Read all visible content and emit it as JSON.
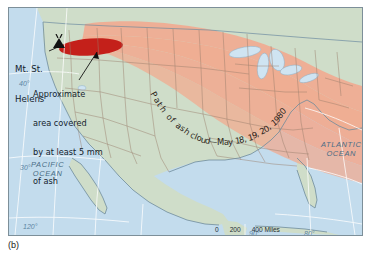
{
  "figure": {
    "panel_label": "(b)",
    "map_kind": "thematic-reference-map",
    "region": "Conterminous United States"
  },
  "colors": {
    "ocean": "#c3dced",
    "land": "#cfddc9",
    "land_under_plume": "#f2a98e",
    "ash_plume": "#f2a98e",
    "heavy_ash_ellipse": "#c4201a",
    "lakes": "#cfe4f2",
    "state_border": "#9a7f6d",
    "coastline": "#6f8b9c",
    "graticule": "#ffffff",
    "frame": "#7d8f99",
    "label_dark": "#15242e",
    "ocean_label": "#4a6e86"
  },
  "annotations": {
    "volcano": {
      "name": "Mt. St. Helens",
      "line1": "Mt. St.",
      "line2": "Helens",
      "marker": "volcano-marker"
    },
    "ash_area": {
      "line1": "Approximate",
      "line2": "area covered",
      "line3": "by at least 5 mm",
      "line4": "of ash",
      "full_text": "Approximate area covered by at least 5 mm of ash"
    },
    "ash_path": {
      "full_text": "Path of ash cloud—May 18, 19, 20, 1980",
      "words": [
        {
          "text": "P",
          "x": 144,
          "y": 79,
          "rot": 62
        },
        {
          "text": "a",
          "x": 147,
          "y": 85,
          "rot": 60
        },
        {
          "text": "t",
          "x": 150,
          "y": 90,
          "rot": 58
        },
        {
          "text": "h",
          "x": 153,
          "y": 94,
          "rot": 56
        },
        {
          "text": " ",
          "x": 157,
          "y": 99,
          "rot": 54
        },
        {
          "text": "o",
          "x": 159,
          "y": 102,
          "rot": 50
        },
        {
          "text": "f",
          "x": 163,
          "y": 106,
          "rot": 48
        },
        {
          "text": " ",
          "x": 166,
          "y": 109,
          "rot": 45
        },
        {
          "text": "a",
          "x": 168,
          "y": 111,
          "rot": 42
        },
        {
          "text": "s",
          "x": 172,
          "y": 114,
          "rot": 38
        },
        {
          "text": "h",
          "x": 176,
          "y": 117,
          "rot": 35
        },
        {
          "text": " ",
          "x": 180,
          "y": 119,
          "rot": 32
        },
        {
          "text": "c",
          "x": 182,
          "y": 121,
          "rot": 28
        },
        {
          "text": "l",
          "x": 186,
          "y": 123,
          "rot": 24
        },
        {
          "text": "o",
          "x": 188,
          "y": 124,
          "rot": 20
        },
        {
          "text": "u",
          "x": 192,
          "y": 126,
          "rot": 16
        },
        {
          "text": "d",
          "x": 196,
          "y": 127,
          "rot": 12
        },
        {
          "text": "—",
          "x": 200,
          "y": 128,
          "rot": 6
        },
        {
          "text": "M",
          "x": 208,
          "y": 129,
          "rot": 0
        },
        {
          "text": "a",
          "x": 215,
          "y": 129,
          "rot": -2
        },
        {
          "text": "y",
          "x": 219,
          "y": 129,
          "rot": -4
        },
        {
          "text": " ",
          "x": 224,
          "y": 129,
          "rot": -6
        },
        {
          "text": "1",
          "x": 226,
          "y": 128,
          "rot": -8
        },
        {
          "text": "8",
          "x": 230,
          "y": 127,
          "rot": -10
        },
        {
          "text": ",",
          "x": 235,
          "y": 126,
          "rot": -12
        },
        {
          "text": "1",
          "x": 239,
          "y": 125,
          "rot": -14
        },
        {
          "text": "9",
          "x": 243,
          "y": 123,
          "rot": -17
        },
        {
          "text": ",",
          "x": 247,
          "y": 121,
          "rot": -20
        },
        {
          "text": "2",
          "x": 251,
          "y": 119,
          "rot": -24
        },
        {
          "text": "0",
          "x": 255,
          "y": 117,
          "rot": -28
        },
        {
          "text": ",",
          "x": 259,
          "y": 114,
          "rot": -32
        },
        {
          "text": "1",
          "x": 263,
          "y": 111,
          "rot": -36
        },
        {
          "text": "9",
          "x": 266,
          "y": 108,
          "rot": -40
        },
        {
          "text": "8",
          "x": 269,
          "y": 104,
          "rot": -44
        },
        {
          "text": "0",
          "x": 272,
          "y": 100,
          "rot": -48
        }
      ]
    }
  },
  "oceans": [
    {
      "id": "pacific",
      "line1": "PACIFIC",
      "line2": "OCEAN",
      "x": 22,
      "y": 152
    },
    {
      "id": "atlantic",
      "line1": "ATLANTIC",
      "line2": "OCEAN",
      "x": 312,
      "y": 132
    }
  ],
  "graticule_labels": [
    {
      "id": "lat-40",
      "text": "40°",
      "x": 10,
      "y": 72
    },
    {
      "id": "lat-30",
      "text": "30°",
      "x": 11,
      "y": 156
    },
    {
      "id": "lon-120",
      "text": "120°",
      "x": 14,
      "y": 215
    },
    {
      "id": "lon-90",
      "text": "90°",
      "x": 240,
      "y": 222
    },
    {
      "id": "lon-80",
      "text": "80°",
      "x": 295,
      "y": 222
    }
  ],
  "scale_bars": [
    {
      "id": "miles",
      "ticks": [
        "0",
        "200",
        "400"
      ],
      "unit": "Miles",
      "label": "0      200      400 Miles"
    },
    {
      "id": "kilometers",
      "ticks": [
        "0",
        "250",
        "500"
      ],
      "unit": "Kilometers",
      "label": "0    250    500 Kilometers"
    }
  ]
}
